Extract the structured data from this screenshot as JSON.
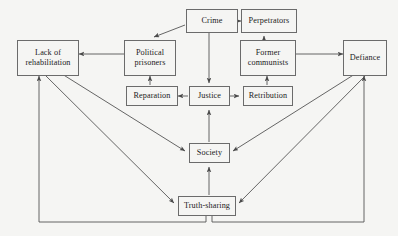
{
  "diagram": {
    "type": "flow-diagram",
    "background_color": "#f5f5f3",
    "box_border_color": "#6b6b6b",
    "edge_color": "#555555",
    "text_color": "#1b1b1b",
    "nodes": [
      {
        "id": "crime",
        "label": "Crime",
        "x": 186,
        "y": 9,
        "w": 52,
        "h": 24
      },
      {
        "id": "perpetrators",
        "label": "Perpetrators",
        "x": 236,
        "y": 9,
        "w": 56,
        "h": 24
      },
      {
        "id": "lack-of-rehabilitation",
        "label": "Lack of\nrehabilitation",
        "x": 17,
        "y": 40,
        "w": 58,
        "h": 32
      },
      {
        "id": "political-prisoners",
        "label": "Political\nprisoners",
        "x": 125,
        "y": 40,
        "w": 50,
        "h": 32
      },
      {
        "id": "former-communists",
        "label": "Former\ncommunists",
        "x": 240,
        "y": 40,
        "w": 54,
        "h": 32
      },
      {
        "id": "defiance",
        "label": "Defiance",
        "x": 347,
        "y": 40,
        "w": 42,
        "h": 32
      },
      {
        "id": "reparation",
        "label": "Reparation",
        "x": 126,
        "y": 86,
        "w": 48,
        "h": 20
      },
      {
        "id": "justice",
        "label": "Justice",
        "x": 189,
        "y": 86,
        "w": 40,
        "h": 20
      },
      {
        "id": "retribution",
        "label": "Retribution",
        "x": 243,
        "y": 86,
        "w": 48,
        "h": 20
      },
      {
        "id": "society",
        "label": "Society",
        "x": 189,
        "y": 143,
        "w": 40,
        "h": 20
      },
      {
        "id": "truth-sharing",
        "label": "Truth-sharing",
        "x": 178,
        "y": 196,
        "w": 56,
        "h": 20
      }
    ],
    "edges": [
      {
        "id": "perpetrators-to-crime",
        "from": "perpetrators",
        "to": "crime",
        "arrow": "single"
      },
      {
        "id": "former-communists-to-perpetrators",
        "from": "former communists",
        "to": "perpetrators",
        "arrow": "single"
      },
      {
        "id": "crime-to-political-prisoners",
        "from": "crime",
        "to": "political prisoners",
        "arrow": "single"
      },
      {
        "id": "crime-to-justice",
        "from": "crime",
        "to": "justice",
        "arrow": "single"
      },
      {
        "id": "political-prisoners-to-lack",
        "from": "political prisoners",
        "to": "lack of rehabilitation",
        "arrow": "single"
      },
      {
        "id": "former-communists-to-defiance",
        "from": "former communists",
        "to": "defiance",
        "arrow": "single"
      },
      {
        "id": "justice-to-reparation",
        "from": "justice",
        "to": "reparation",
        "arrow": "single"
      },
      {
        "id": "justice-to-retribution",
        "from": "justice",
        "to": "retribution",
        "arrow": "single"
      },
      {
        "id": "reparation-to-political-prisoners",
        "from": "reparation",
        "to": "political prisoners",
        "arrow": "single"
      },
      {
        "id": "retribution-to-former-communists",
        "from": "retribution",
        "to": "former communists",
        "arrow": "single"
      },
      {
        "id": "society-to-justice",
        "from": "society",
        "to": "justice",
        "arrow": "single"
      },
      {
        "id": "truth-sharing-to-society",
        "from": "truth-sharing",
        "to": "society",
        "arrow": "single"
      },
      {
        "id": "lack-society-bidirectional",
        "from": "lack of rehabilitation",
        "to": "society",
        "arrow": "double"
      },
      {
        "id": "lack-truth-sharing-bidirectional",
        "from": "lack of rehabilitation",
        "to": "truth-sharing",
        "arrow": "double"
      },
      {
        "id": "defiance-society-bidirectional",
        "from": "defiance",
        "to": "society",
        "arrow": "double"
      },
      {
        "id": "defiance-truth-sharing-bidirectional",
        "from": "defiance",
        "to": "truth-sharing",
        "arrow": "double"
      },
      {
        "id": "truth-sharing-rail-to-lack",
        "from": "truth-sharing",
        "to": "lack of rehabilitation",
        "arrow": "single"
      },
      {
        "id": "truth-sharing-rail-to-defiance",
        "from": "truth-sharing",
        "to": "defiance",
        "arrow": "single"
      }
    ]
  }
}
